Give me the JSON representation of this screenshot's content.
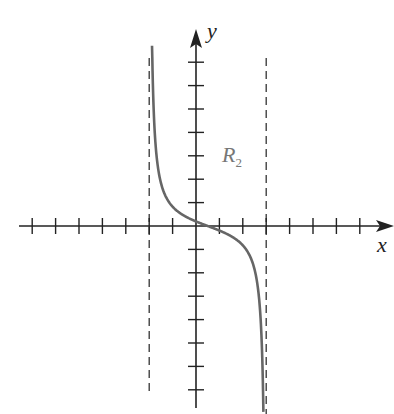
{
  "chart_data": {
    "type": "line",
    "title": "",
    "xlabel": "x",
    "ylabel": "y",
    "annotations": [
      {
        "text": "R",
        "subscript": "2",
        "x": 1.3,
        "y": 3.3
      }
    ],
    "x_ticks": [
      -7,
      -6,
      -5,
      -4,
      -3,
      -2,
      -1,
      1,
      2,
      3,
      4,
      5,
      6,
      7
    ],
    "y_ticks": [
      -7,
      -6,
      -5,
      -4,
      -3,
      -2,
      -1,
      1,
      2,
      3,
      4,
      5,
      6,
      7
    ],
    "xlim": [
      -7.5,
      8.5
    ],
    "ylim": [
      -7.8,
      8.3
    ],
    "grid": false,
    "vertical_asymptotes": [
      -2,
      3
    ],
    "series": [
      {
        "name": "curve",
        "formula": "y = -0.6*tan(pi*(x-0.5)/5)",
        "x_range": [
          -1.88,
          2.88
        ],
        "points": [
          [
            -1.9,
            7.3
          ],
          [
            -1.7,
            3.7
          ],
          [
            -1.5,
            2.3
          ],
          [
            -1,
            1.0
          ],
          [
            -0.5,
            0.44
          ],
          [
            0,
            0.2
          ],
          [
            0.5,
            0
          ],
          [
            1,
            -0.2
          ],
          [
            1.5,
            -0.44
          ],
          [
            2,
            -1.0
          ],
          [
            2.5,
            -2.3
          ],
          [
            2.7,
            -3.7
          ],
          [
            2.9,
            -7.3
          ]
        ]
      }
    ],
    "colors": {
      "curve": "#666666",
      "axes": "#222222",
      "asymptote": "#333333",
      "annotation": "#777777"
    }
  }
}
